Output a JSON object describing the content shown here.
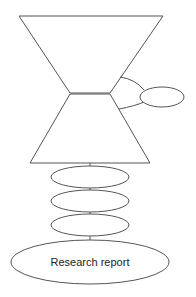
{
  "diagram": {
    "type": "hourglass-flow",
    "stroke_color": "#555555",
    "background": "#ffffff",
    "shapes": [
      {
        "id": "top-funnel",
        "kind": "inverted-trapezoid",
        "label": ""
      },
      {
        "id": "bottom-funnel",
        "kind": "trapezoid",
        "label": ""
      },
      {
        "id": "side-ellipse",
        "kind": "ellipse",
        "label": ""
      },
      {
        "id": "stage-ellipse-1",
        "kind": "ellipse",
        "label": ""
      },
      {
        "id": "stage-ellipse-2",
        "kind": "ellipse",
        "label": ""
      },
      {
        "id": "stage-ellipse-3",
        "kind": "ellipse",
        "label": ""
      },
      {
        "id": "final-ellipse",
        "kind": "ellipse",
        "label": "Research report"
      }
    ]
  }
}
